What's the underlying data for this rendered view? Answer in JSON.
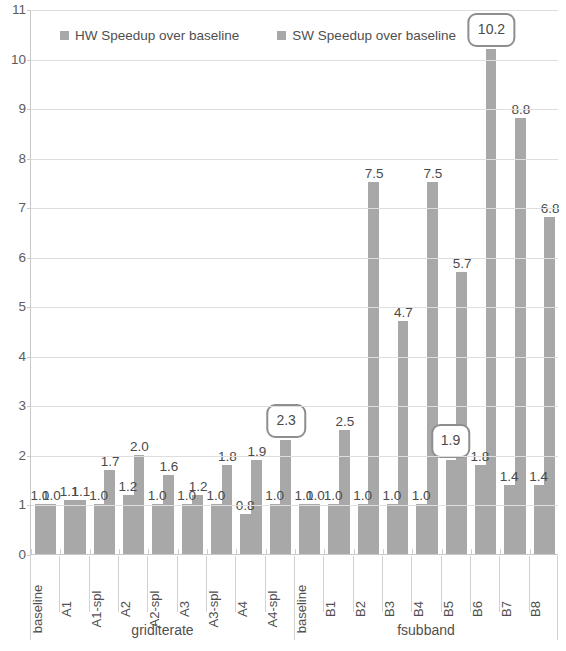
{
  "chart_data": {
    "type": "bar",
    "title": "",
    "xlabel": "",
    "ylabel": "",
    "ylim": [
      0,
      11
    ],
    "ytick_labels": [
      "0",
      "1",
      "2",
      "3",
      "4",
      "5",
      "6",
      "7",
      "8",
      "9",
      "10",
      "11"
    ],
    "grid": true,
    "legend_position": "top-left",
    "categories": [
      "baseline",
      "A1",
      "A1-spl",
      "A2",
      "A2-spl",
      "A3",
      "A3-spl",
      "A4",
      "A4-spl",
      "baseline",
      "B1",
      "B2",
      "B3",
      "B4",
      "B5",
      "B6",
      "B7",
      "B8"
    ],
    "groups": [
      {
        "label": "griditerate",
        "span": 9
      },
      {
        "label": "fsubband",
        "span": 9
      }
    ],
    "series": [
      {
        "name": "HW Speedup over baseline",
        "color": "#a8a8a8",
        "values": [
          1.0,
          1.1,
          1.0,
          1.2,
          1.0,
          1.0,
          1.0,
          0.8,
          1.0,
          1.0,
          1.0,
          1.0,
          1.0,
          1.0,
          1.9,
          1.8,
          1.4,
          1.4
        ]
      },
      {
        "name": "SW Speedup over baseline",
        "color": "#a8a8a8",
        "values": [
          1.0,
          1.1,
          1.7,
          2.0,
          1.6,
          1.2,
          1.8,
          1.9,
          2.3,
          1.0,
          2.5,
          7.5,
          4.7,
          7.5,
          5.7,
          10.2,
          8.8,
          6.8
        ]
      }
    ],
    "highlighted_labels": [
      "2.3",
      "10.2",
      "1.9"
    ],
    "data_labels": {
      "griditerate": {
        "hw": [
          "1.0",
          "1.1",
          "1.0",
          "1.2",
          "1.0",
          "1.0",
          "1.0",
          "0.8",
          "1.0"
        ],
        "sw": [
          "1.0",
          "1.1",
          "1.7",
          "2.0",
          "1.6",
          "1.2",
          "1.8",
          "1.9",
          "2.3"
        ]
      },
      "fsubband": {
        "hw": [
          "1.0",
          "1.0",
          "1.0",
          "1.0",
          "1.0",
          "1.9",
          "1.8",
          "1.4",
          "1.4"
        ],
        "sw": [
          "1.0",
          "2.5",
          "7.5",
          "4.7",
          "7.5",
          "5.7",
          "10.2",
          "8.8",
          "6.8"
        ]
      }
    }
  },
  "legend": {
    "items": [
      {
        "label": "HW Speedup over baseline"
      },
      {
        "label": "SW Speedup over baseline"
      }
    ]
  }
}
